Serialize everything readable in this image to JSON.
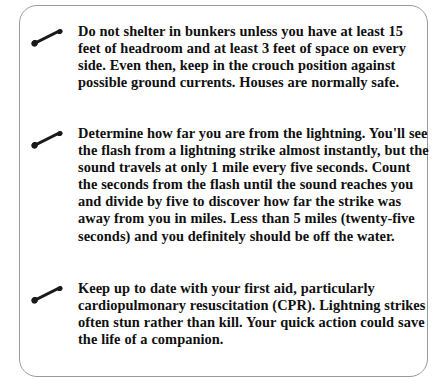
{
  "page": {
    "background_color": "#ffffff",
    "text_color": "#101010",
    "border_color": "#9a9a9a"
  },
  "tip_box": {
    "bullet_icon": "lightning-bolt-dash-bullet-icon",
    "items": [
      {
        "bullet": "lightning-bolt-dash-bullet-icon",
        "text": "Do not shelter in bunkers unless you have at least 15 feet of headroom and at least 3 feet of space on every side. Even then, keep in the crouch position against possible ground currents. Houses are normally safe."
      },
      {
        "bullet": "lightning-bolt-dash-bullet-icon",
        "text": "Determine how far you are from the lightning. You'll see the flash from a lightning strike almost instantly, but the sound travels at only 1 mile every five seconds. Count the seconds from the flash until the sound reaches you and divide by five to discover how far the strike was away from you in miles. Less than 5 miles (twenty-five seconds) and you definitely should be off the water."
      },
      {
        "bullet": "lightning-bolt-dash-bullet-icon",
        "text": "Keep up to date with your first aid, particularly cardiopulmonary resuscitation (CPR). Lightning strikes often stun rather than kill. Your quick action could save the life of a companion."
      }
    ]
  }
}
